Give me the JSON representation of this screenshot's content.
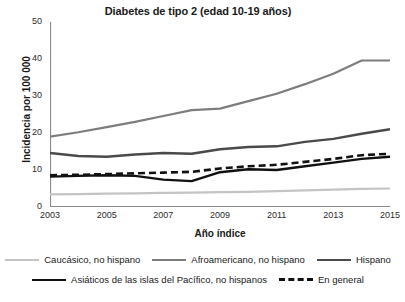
{
  "chart_data": {
    "type": "line",
    "title": "Diabetes de tipo 2 (edad 10-19 años)",
    "xlabel": "Año índice",
    "ylabel": "Incidencia por 100 000",
    "xlim": [
      2003,
      2015
    ],
    "ylim": [
      0,
      50
    ],
    "yticks": [
      0,
      10,
      20,
      30,
      40,
      50
    ],
    "ytick_labels": [
      "0",
      "10",
      "20",
      "30",
      "40",
      "50"
    ],
    "xticks": [
      2003,
      2005,
      2007,
      2009,
      2011,
      2013,
      2015
    ],
    "xtick_labels": [
      "2003",
      "2005",
      "2007",
      "2009",
      "2011",
      "2013",
      "2015"
    ],
    "grid": false,
    "legend_position": "bottom",
    "x": [
      2003,
      2004,
      2005,
      2006,
      2007,
      2008,
      2009,
      2010,
      2011,
      2012,
      2013,
      2014,
      2015
    ],
    "series": [
      {
        "name": "Caucásico, no hispano",
        "color": "#c4c4c4",
        "style": "solid",
        "width": 2.2,
        "values": [
          3.4,
          3.5,
          3.6,
          3.7,
          3.8,
          3.9,
          4.0,
          4.1,
          4.3,
          4.5,
          4.7,
          4.9,
          5.0
        ]
      },
      {
        "name": "Afroamericano, no hispano",
        "color": "#7d7d7d",
        "style": "solid",
        "width": 2.2,
        "values": [
          19.0,
          20.2,
          21.6,
          23.0,
          24.6,
          26.2,
          26.6,
          28.6,
          30.6,
          33.2,
          36.0,
          39.6,
          39.6
        ]
      },
      {
        "name": "Hispano",
        "color": "#4a4a4a",
        "style": "solid",
        "width": 2.4,
        "values": [
          14.6,
          13.8,
          13.6,
          14.2,
          14.6,
          14.4,
          15.6,
          16.2,
          16.4,
          17.6,
          18.4,
          19.8,
          21.0
        ]
      },
      {
        "name": "Asiáticos de las islas del Pacífico, no hispanos",
        "color": "#111111",
        "style": "solid",
        "width": 2.4,
        "values": [
          8.2,
          8.4,
          8.6,
          8.4,
          7.4,
          7.0,
          9.4,
          10.2,
          10.0,
          11.0,
          12.0,
          13.0,
          13.6
        ]
      },
      {
        "name": "En general",
        "color": "#111111",
        "style": "dashed",
        "width": 2.6,
        "values": [
          8.6,
          8.7,
          8.9,
          9.1,
          9.3,
          9.5,
          10.4,
          11.0,
          11.4,
          12.2,
          13.0,
          14.0,
          14.4
        ]
      }
    ]
  },
  "legend": {
    "rows": [
      [
        {
          "label": "Caucásico, no hispano",
          "series": 0
        },
        {
          "label": "Afroamericano, no hispano",
          "series": 1
        },
        {
          "label": "Hispano",
          "series": 2
        }
      ],
      [
        {
          "label": "Asiáticos de las islas del Pacífico, no hispanos",
          "series": 3
        },
        {
          "label": "En general",
          "series": 4
        }
      ]
    ]
  }
}
